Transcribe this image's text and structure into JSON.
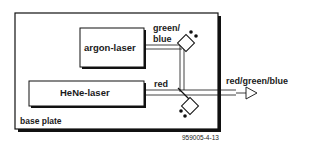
{
  "diagram": {
    "base_plate": {
      "label": "base plate"
    },
    "argon_laser": {
      "label": "argon-laser"
    },
    "hene_laser": {
      "label": "HeNe-laser"
    },
    "beams": {
      "green_blue_label_line1": "green/",
      "green_blue_label_line2": "blue",
      "red_label": "red",
      "output_label": "red/green/blue"
    },
    "figure_code": "959005-4-13",
    "colors": {
      "line": "#111111",
      "background": "#ffffff"
    }
  }
}
